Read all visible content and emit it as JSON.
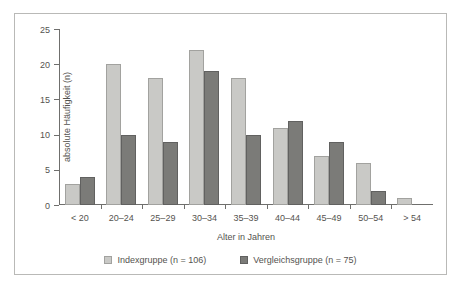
{
  "chart_data": {
    "type": "bar",
    "title": "",
    "xlabel": "Alter in Jahren",
    "ylabel": "absolute Häufigkeit (n)",
    "categories": [
      "< 20",
      "20–24",
      "25–29",
      "30–34",
      "35–39",
      "40–44",
      "45–49",
      "50–54",
      "> 54"
    ],
    "series": [
      {
        "name": "Indexgruppe (n = 106)",
        "values": [
          3,
          20,
          18,
          22,
          18,
          11,
          7,
          6,
          1
        ],
        "color": "#c9c9c6"
      },
      {
        "name": "Vergleichsgruppe (n = 75)",
        "values": [
          4,
          10,
          9,
          19,
          10,
          12,
          9,
          2,
          0
        ],
        "color": "#7b7b78"
      }
    ],
    "yticks": [
      0,
      5,
      10,
      15,
      20,
      25
    ],
    "ylim": [
      0,
      25
    ],
    "grid": false,
    "legend_position": "bottom"
  },
  "legend": {
    "items": [
      {
        "label": "Indexgruppe (n = 106)",
        "swatch": "legend-swatch-index"
      },
      {
        "label": "Vergleichsgruppe (n = 75)",
        "swatch": "legend-swatch-vergleich"
      }
    ]
  }
}
